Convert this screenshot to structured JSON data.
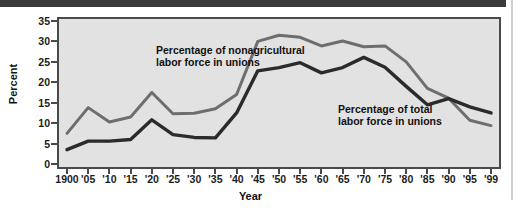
{
  "chart_data": {
    "type": "line",
    "title": "",
    "xlabel": "Year",
    "ylabel": "Percent",
    "ylim": [
      0,
      35
    ],
    "ytick_values": [
      0,
      5,
      10,
      15,
      20,
      25,
      30,
      35
    ],
    "ytick_labels": [
      "0",
      "5",
      "10",
      "15",
      "20",
      "25",
      "30",
      "35"
    ],
    "grid": false,
    "legend_position": "inline-annotations",
    "x": [
      1900,
      1905,
      1910,
      1915,
      1920,
      1925,
      1930,
      1935,
      1940,
      1945,
      1950,
      1955,
      1960,
      1965,
      1970,
      1975,
      1980,
      1985,
      1990,
      1995,
      1999
    ],
    "categories": [
      "1900",
      "'05",
      "'10",
      "'15",
      "'20",
      "'25",
      "'30",
      "'35",
      "'40",
      "'45",
      "'50",
      "'55",
      "'60",
      "'65",
      "'70",
      "'75",
      "'80",
      "'85",
      "'90",
      "'95",
      "'99"
    ],
    "series": [
      {
        "name": "Percentage of nonagricultural labor force in unions",
        "color": "#6e6e6e",
        "values": [
          7.5,
          13.8,
          10.3,
          11.5,
          17.5,
          12.3,
          12.4,
          13.5,
          17.0,
          30.0,
          31.5,
          31.0,
          28.9,
          30.1,
          28.7,
          28.9,
          25.0,
          18.5,
          16.1,
          10.7,
          9.4
        ]
      },
      {
        "name": "Percentage of total labor force in unions",
        "color": "#2b2b2b",
        "values": [
          3.5,
          5.6,
          5.6,
          6.0,
          10.8,
          7.2,
          6.5,
          6.4,
          12.5,
          22.8,
          23.6,
          24.8,
          22.3,
          23.6,
          26.1,
          23.7,
          19.0,
          14.5,
          16.0,
          14.0,
          12.5
        ]
      }
    ],
    "annotations": [
      {
        "id": "nonagricultural-label",
        "text": "Percentage of nonagricultural\nlabor force in unions"
      },
      {
        "id": "total-label",
        "text": "Percentage of total\nlabor force in unions"
      }
    ]
  },
  "colors": {
    "plot_background": "#e2e2e2",
    "frame": "#4a4a4a",
    "page_background": "#ffffff",
    "top_rule": "#3b3b3b",
    "nonagricultural_line": "#6e6e6e",
    "total_line": "#2b2b2b",
    "text": "#111111"
  }
}
